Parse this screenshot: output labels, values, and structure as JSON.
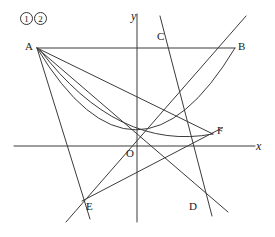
{
  "figure": {
    "type": "geometry-diagram",
    "width": 275,
    "height": 237,
    "stroke_color": "#3b3b3b",
    "background_color": "#ffffff",
    "axes": {
      "x_axis_label": "x",
      "y_axis_label": "y",
      "origin_label": "O",
      "origin_px": [
        137,
        146
      ],
      "x_axis_y_px": 146,
      "y_axis_x_px": 137,
      "x_axis_from_px": [
        14,
        146
      ],
      "x_axis_to_px": [
        255,
        146
      ],
      "y_axis_from_px": [
        137,
        14
      ],
      "y_axis_to_px": [
        137,
        222
      ]
    },
    "curve_tags": [
      {
        "label": "1",
        "x": 20,
        "y": 12
      },
      {
        "label": "2",
        "x": 34,
        "y": 12
      }
    ],
    "points": [
      {
        "name": "A",
        "px": [
          37,
          48
        ],
        "label_px": [
          25,
          42
        ]
      },
      {
        "name": "B",
        "px": [
          235,
          48
        ],
        "label_px": [
          239,
          42
        ]
      },
      {
        "name": "C",
        "px": [
          172,
          48
        ],
        "label_px": [
          158,
          32
        ]
      },
      {
        "name": "D",
        "px": [
          201,
          199
        ],
        "label_px": [
          190,
          202
        ]
      },
      {
        "name": "E",
        "px": [
          82,
          201
        ],
        "label_px": [
          86,
          202
        ]
      },
      {
        "name": "F",
        "px": [
          213,
          134
        ],
        "label_px": [
          218,
          126
        ]
      },
      {
        "name": "O",
        "px": [
          137,
          146
        ],
        "label_px": [
          126,
          148
        ]
      }
    ],
    "parabola": {
      "vertex_px": [
        147,
        153
      ],
      "through_px": [
        [
          37,
          48
        ],
        [
          235,
          48
        ]
      ],
      "path": "M 37 48 Q 147 210 235 48"
    },
    "curve2": {
      "note": "second curve tagged 2 from A sweeping to F region",
      "path": "M 37 48 Q 120 150 213 134"
    },
    "segments": [
      {
        "name": "AB",
        "from_px": [
          37,
          48
        ],
        "to_px": [
          235,
          48
        ]
      },
      {
        "name": "AD",
        "from_px": [
          37,
          48
        ],
        "to_px": [
          228,
          212
        ]
      },
      {
        "name": "AE-extended",
        "from_px": [
          37,
          48
        ],
        "to_px": [
          90,
          219
        ]
      },
      {
        "name": "AF",
        "from_px": [
          37,
          48
        ],
        "to_px": [
          213,
          134
        ]
      },
      {
        "name": "EB-extended",
        "from_px": [
          66,
          222
        ],
        "to_px": [
          246,
          16
        ]
      },
      {
        "name": "EF",
        "from_px": [
          82,
          201
        ],
        "to_px": [
          222,
          128
        ]
      },
      {
        "name": "CD-extended",
        "from_px": [
          160,
          16
        ],
        "to_px": [
          212,
          216
        ]
      }
    ]
  }
}
